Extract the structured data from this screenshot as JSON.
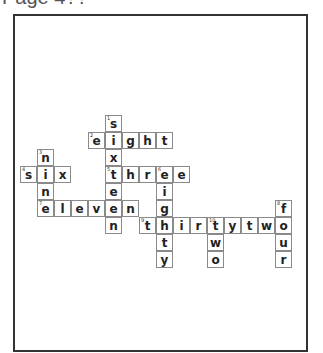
{
  "page": {
    "title": "Page 4??"
  },
  "crossword": {
    "cell_size": 17,
    "origin": {
      "x": 20,
      "y": 115
    },
    "words": [
      {
        "number": 1,
        "answer": "sixteen",
        "direction": "down",
        "row": 0,
        "col": 5
      },
      {
        "number": 2,
        "answer": "eight",
        "direction": "across",
        "row": 1,
        "col": 4
      },
      {
        "number": 3,
        "answer": "nine",
        "direction": "down",
        "row": 2,
        "col": 1
      },
      {
        "number": 4,
        "answer": "six",
        "direction": "across",
        "row": 3,
        "col": 0
      },
      {
        "number": 5,
        "answer": "three",
        "direction": "across",
        "row": 3,
        "col": 5
      },
      {
        "number": 6,
        "answer": "eighty",
        "direction": "down",
        "row": 3,
        "col": 8
      },
      {
        "number": 7,
        "answer": "eleven",
        "direction": "across",
        "row": 5,
        "col": 1
      },
      {
        "number": 8,
        "answer": "four",
        "direction": "down",
        "row": 5,
        "col": 15
      },
      {
        "number": 9,
        "answer": "thirtytwo",
        "direction": "across",
        "row": 6,
        "col": 7
      },
      {
        "number": 10,
        "answer": "two",
        "direction": "down",
        "row": 6,
        "col": 11
      }
    ]
  }
}
